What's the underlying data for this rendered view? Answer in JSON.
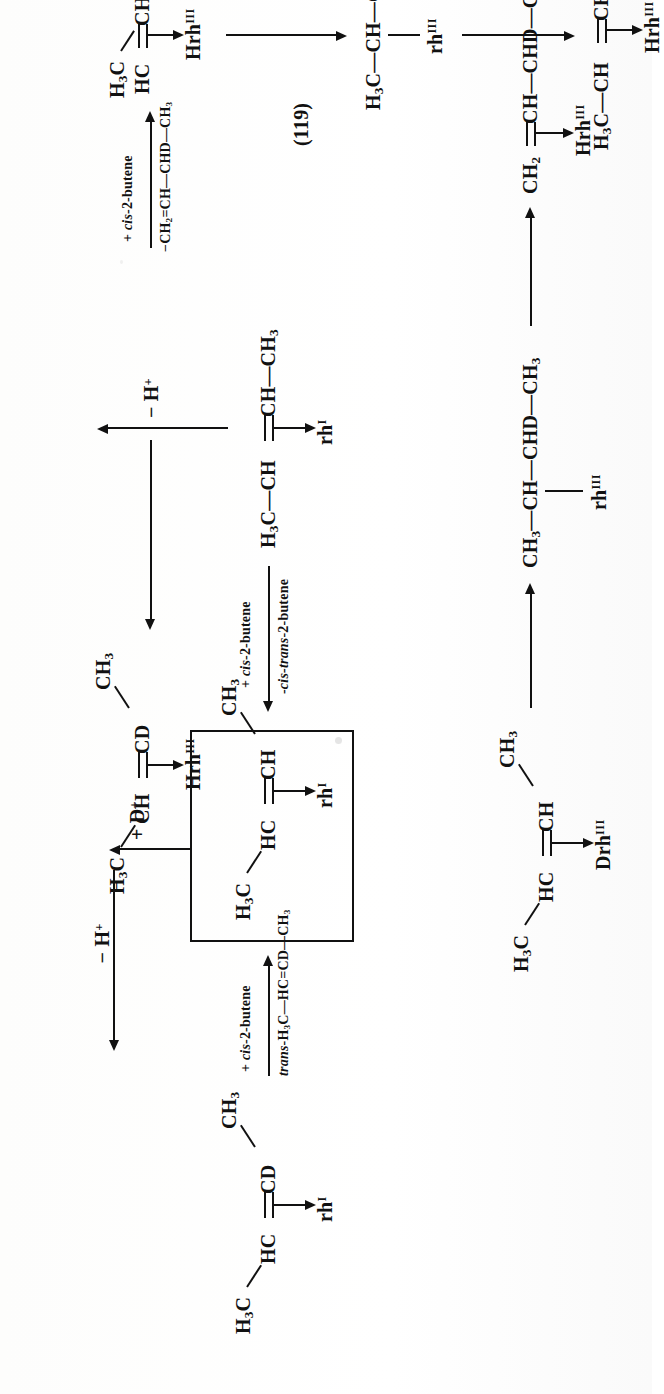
{
  "document": {
    "type": "chemical-reaction-scheme",
    "equation_number": "(119)",
    "description": "Rhodium-catalysed deuterium-labelled butene isomerisation scheme",
    "orientation": "rotated-90-ccw"
  },
  "species": {
    "start_cd_butene": {
      "top_right": "CH3",
      "chain_left": "H3C",
      "chain_mid": "HC",
      "chain_right": "CD",
      "catalyst": "rh",
      "catalyst_sup": "I"
    },
    "boxed_intermediate": {
      "top_right": "CH3",
      "chain_left": "H3C",
      "chain_mid": "HC",
      "chain_right": "CH",
      "catalyst": "rh",
      "catalyst_sup": "I"
    },
    "cis_2_butene_rh1": {
      "chain": "H3C—CH=CH—CH3",
      "catalyst": "rh",
      "catalyst_sup": "I"
    },
    "deuterio_butene_drh": {
      "top_right": "CH3",
      "chain_left": "H3C",
      "chain_mid": "HC",
      "chain_right": "CH",
      "catalyst": "Drh",
      "catalyst_sup": "III"
    },
    "sec_butyl_rh3": {
      "chain": "CH3—CH—CHD—CH3",
      "catalyst": "rh",
      "catalyst_sup": "III"
    },
    "butene_hrh3_top": {
      "chain": "CH2=CH—CHD—CH3",
      "catalyst": "Hrh",
      "catalyst_sup": "III"
    },
    "cd_butene_hrh3": {
      "top_right": "CH3",
      "chain_left": "H3C",
      "chain_mid": "CH",
      "chain_right": "CD",
      "catalyst": "Hrh",
      "catalyst_sup": "III"
    },
    "cis_butene_hrh3_right": {
      "top_right": "CH3",
      "chain_left": "H3C",
      "chain_mid": "HC",
      "chain_right": "CH",
      "catalyst": "Hrh",
      "catalyst_sup": "III"
    },
    "butyl_rh3_right": {
      "chain": "H3C—CH—C2H5",
      "catalyst": "rh",
      "catalyst_sup": "III"
    },
    "butene_hrh3_right": {
      "chain": "H3C—CH=CH—CH3",
      "catalyst": "Hrh",
      "catalyst_sup": "III"
    }
  },
  "labels": {
    "eq": "(119)",
    "arrow1_top": "+ cis-2-butene",
    "arrow1_bottom": "trans-H3C—HC=CD—CH3",
    "arrow_d_plus": "+ D+",
    "arrow_back_top": "+ cis-2-butene",
    "arrow_back_bottom": "-cis-trans-2-butene",
    "minus_h_plus_right": "− H+",
    "minus_h_plus_left": "− H+",
    "arrow_top_right_top": "+ cis-2-butene",
    "arrow_top_right_bottom": "−CH2=CH—CHD—CH3"
  },
  "colors": {
    "ink": "#111111",
    "paper": "#ffffff"
  }
}
